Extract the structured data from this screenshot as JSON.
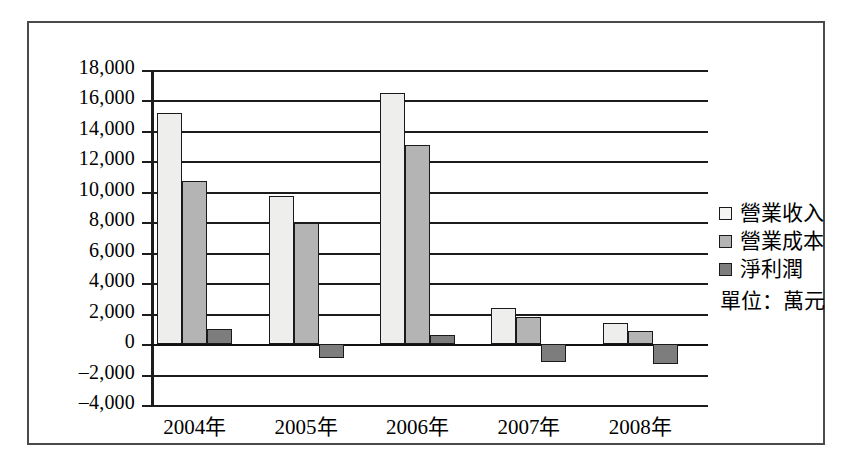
{
  "chart_data": {
    "type": "bar",
    "title": "",
    "xlabel": "",
    "ylabel": "",
    "categories": [
      "2004年",
      "2005年",
      "2006年",
      "2007年",
      "2008年"
    ],
    "series": [
      {
        "name": "營業收入",
        "color": "#eeeeec",
        "values": [
          15200,
          9700,
          16500,
          2400,
          1400
        ]
      },
      {
        "name": "營業成本",
        "color": "#b4b4b4",
        "values": [
          10700,
          7950,
          13100,
          1800,
          850
        ]
      },
      {
        "name": "淨利潤",
        "color": "#7d7d7d",
        "values": [
          1000,
          -900,
          600,
          -1200,
          -1300
        ]
      }
    ],
    "ylim": [
      -4000,
      18000
    ],
    "ytick_values": [
      18000,
      16000,
      14000,
      12000,
      10000,
      8000,
      6000,
      4000,
      2000,
      0,
      -2000,
      -4000
    ],
    "ytick_labels": [
      "18,000",
      "16,000",
      "14,000",
      "12,000",
      "10,000",
      "8,000",
      "6,000",
      "4,000",
      "2,000",
      "0",
      "–2,000",
      "–4,000"
    ],
    "grid": true,
    "legend_position": "right",
    "unit_note": "單位：萬元"
  },
  "legend": {
    "items": [
      {
        "label": "營業收入"
      },
      {
        "label": "營業成本"
      },
      {
        "label": "淨利潤"
      }
    ],
    "unit": "單位：萬元"
  }
}
